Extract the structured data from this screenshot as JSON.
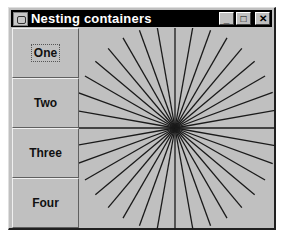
{
  "window": {
    "title": "Nesting containers",
    "controls": {
      "minimize": "_",
      "maximize": "□",
      "close": "✕"
    }
  },
  "buttons": [
    {
      "label": "One",
      "focused": true
    },
    {
      "label": "Two",
      "focused": false
    },
    {
      "label": "Three",
      "focused": false
    },
    {
      "label": "Four",
      "focused": false
    }
  ],
  "canvas": {
    "shape": "starburst",
    "line_count": 36,
    "angle_step_deg": 10,
    "line_color": "#1a1a1a",
    "background": "#c0c0c0"
  }
}
